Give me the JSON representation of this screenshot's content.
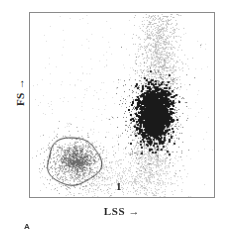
{
  "figure": {
    "panel_label": "A",
    "background_color": "#ffffff",
    "frame_color": "#8a8a8a"
  },
  "axes": {
    "y_label": "FS →",
    "x_label": "LSS →",
    "y_label_text": "FS",
    "x_label_text": "LSS",
    "arrow_glyph": "→"
  },
  "gates": [
    {
      "id": "gate-1",
      "label": "1",
      "label_x": 86,
      "label_y": 167,
      "shape": "closed-freehand-ellipse",
      "stroke_color": "#2a2a2a",
      "center_x": 73,
      "center_y": 162,
      "radius_x": 27,
      "radius_y": 24
    }
  ],
  "chart_data": {
    "type": "scatter",
    "title": "",
    "xlabel": "LSS →",
    "ylabel": "FS →",
    "xlim": [
      0,
      1
    ],
    "ylim": [
      0,
      1
    ],
    "grid": false,
    "axis_ticks": false,
    "note": "Flow cytometry dot plot: forward scatter (FS) vs large-angle side scatter (LSS). Axes unlabeled/arbitrary units with direction arrows only.",
    "populations": [
      {
        "name": "gated-population-1",
        "gate_label": "1",
        "description": "Low LSS / low FS cluster enclosed by gate 1",
        "center": [
          0.236,
          0.195
        ],
        "spread": [
          0.075,
          0.065
        ],
        "n_points": 900,
        "density": "medium",
        "dot_color": "#9a9a9a",
        "core_center": [
          0.255,
          0.205
        ],
        "core_spread": [
          0.035,
          0.028
        ],
        "core_points": 420,
        "core_color": "#6d6d6d"
      },
      {
        "name": "dense-cluster",
        "description": "Dense dark cluster at high LSS, mid FS; vertically elongated",
        "center": [
          0.672,
          0.455
        ],
        "spread": [
          0.042,
          0.072
        ],
        "n_points": 1700,
        "density": "very-high",
        "dot_color": "#1a1a1a",
        "halo_spread": [
          0.078,
          0.12
        ],
        "halo_points": 900,
        "halo_color": "#787878"
      },
      {
        "name": "upper-streak",
        "description": "Faint vertical streak of events extending upward from the dense cluster to the top of the plot",
        "center": [
          0.7,
          0.8
        ],
        "spread": [
          0.055,
          0.16
        ],
        "n_points": 1100,
        "density": "low",
        "dot_color": "#bdbdbd"
      },
      {
        "name": "lower-column",
        "description": "Faint column of events below the dense cluster toward the x-axis",
        "center": [
          0.655,
          0.19
        ],
        "spread": [
          0.06,
          0.12
        ],
        "n_points": 700,
        "density": "low",
        "dot_color": "#c6c6c6"
      },
      {
        "name": "bottom-band",
        "description": "Sparse band of events along the lower portion of the plot between the two populations",
        "center": [
          0.45,
          0.11
        ],
        "spread": [
          0.17,
          0.07
        ],
        "n_points": 600,
        "density": "very-low",
        "dot_color": "#cfcfcf"
      },
      {
        "name": "background-noise",
        "description": "Sparse background events scattered over the whole plotting area",
        "center": [
          0.5,
          0.5
        ],
        "spread": [
          0.3,
          0.3
        ],
        "n_points": 420,
        "density": "sparse",
        "dot_color": "#dcdcdc"
      }
    ]
  }
}
